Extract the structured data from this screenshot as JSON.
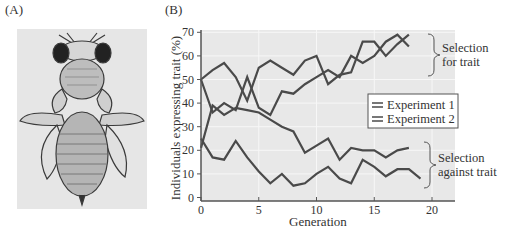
{
  "panels": {
    "a_label": "(A)",
    "b_label": "(B)"
  },
  "illustration": {
    "subject": "fruit fly drawing (dorsal view)"
  },
  "colors": {
    "line": "#4a4a4a",
    "plot_bg": "#e8e8e8",
    "grid": "#f7f7f7",
    "axis": "#555555",
    "legend_border": "#555555"
  },
  "chart_data": {
    "type": "line",
    "title": "",
    "xlabel": "Generation",
    "ylabel": "Individuals expressing trait (%)",
    "xlim": [
      0,
      22
    ],
    "ylim": [
      0,
      70
    ],
    "xticks": [
      0,
      5,
      10,
      15,
      20
    ],
    "yticks": [
      0,
      10,
      20,
      30,
      40,
      50,
      60,
      70
    ],
    "grid": true,
    "legend": [
      "Experiment 1",
      "Experiment 2"
    ],
    "legend_position": "right-middle",
    "annotations": [
      {
        "text_lines": [
          "Selection",
          "for trait"
        ],
        "target": "upper group"
      },
      {
        "text_lines": [
          "Selection",
          "against trait"
        ],
        "target": "lower group"
      }
    ],
    "series": [
      {
        "name": "Experiment 1 – selection for trait",
        "x": [
          0,
          1,
          2,
          3,
          4,
          5,
          6,
          7,
          8,
          9,
          10,
          11,
          12,
          13,
          14,
          15,
          16,
          17,
          18
        ],
        "y": [
          50,
          54,
          57,
          51,
          41,
          55,
          58,
          55,
          52,
          58,
          60,
          48,
          52,
          53,
          66,
          66,
          60,
          65,
          69
        ]
      },
      {
        "name": "Experiment 2 – selection for trait",
        "x": [
          0,
          1,
          2,
          3,
          4,
          5,
          6,
          7,
          8,
          9,
          10,
          11,
          12,
          13,
          14,
          15,
          16,
          17,
          18
        ],
        "y": [
          50,
          36,
          40,
          37,
          51,
          38,
          35,
          45,
          44,
          48,
          51,
          54,
          51,
          60,
          57,
          60,
          66,
          69,
          64
        ]
      },
      {
        "name": "Experiment 1 – selection against trait",
        "x": [
          0,
          1,
          2,
          3,
          4,
          5,
          6,
          7,
          8,
          9,
          10,
          11,
          12,
          13,
          14,
          15,
          16,
          17,
          18
        ],
        "y": [
          21,
          39,
          35,
          38,
          37,
          36,
          33,
          30,
          28,
          19,
          22,
          25,
          16,
          21,
          20,
          20,
          17,
          20,
          21
        ]
      },
      {
        "name": "Experiment 2 – selection against trait",
        "x": [
          0,
          1,
          2,
          3,
          4,
          5,
          6,
          7,
          8,
          9,
          10,
          11,
          12,
          13,
          14,
          15,
          16,
          17,
          18,
          19
        ],
        "y": [
          25,
          17,
          16,
          24,
          17,
          11,
          6,
          10,
          5,
          6,
          10,
          13,
          8,
          6,
          16,
          13,
          9,
          12,
          12,
          8
        ]
      }
    ]
  }
}
